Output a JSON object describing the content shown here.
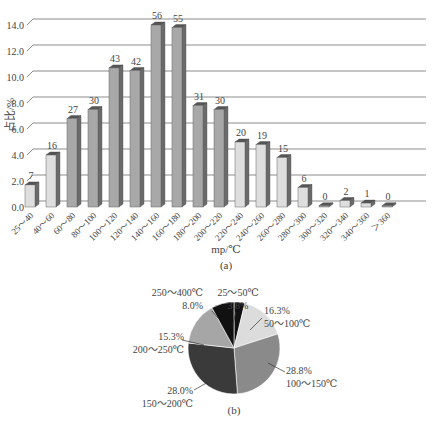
{
  "chart_data": [
    {
      "type": "bar",
      "title": "",
      "caption": "(a)",
      "xlabel": "mp/℃",
      "ylabel": "占比/%",
      "ylim": [
        0,
        14
      ],
      "yticks": [
        "0.0",
        "2.0",
        "4.0",
        "6.0",
        "8.0",
        "10.0",
        "12.0",
        "14.0"
      ],
      "grid": true,
      "categories": [
        "25～40",
        "40～60",
        "60～80",
        "80～100",
        "100～120",
        "120～140",
        "140～160",
        "160～180",
        "180～200",
        "200～220",
        "220～240",
        "240～260",
        "260～280",
        "280～300",
        "300～320",
        "320～340",
        "340～360",
        "＞360"
      ],
      "values": [
        1.7,
        4.0,
        6.8,
        7.5,
        10.7,
        10.5,
        14.0,
        13.8,
        7.8,
        7.5,
        5.0,
        4.8,
        3.8,
        1.5,
        0.0,
        0.5,
        0.3,
        0.0
      ],
      "counts": [
        7,
        16,
        27,
        30,
        43,
        42,
        56,
        55,
        31,
        30,
        20,
        19,
        15,
        6,
        0,
        2,
        1,
        0
      ],
      "bar_shade": [
        "light",
        "light",
        "dark",
        "dark",
        "dark",
        "dark",
        "dark",
        "dark",
        "dark",
        "dark",
        "light",
        "light",
        "light",
        "light",
        "dark",
        "light",
        "light",
        "dark"
      ]
    },
    {
      "type": "pie",
      "caption": "(b)",
      "slices": [
        {
          "label": "25～50℃",
          "value": 3.8,
          "pct_label": "3.8%",
          "color": "#111111"
        },
        {
          "label": "50～100℃",
          "value": 16.3,
          "pct_label": "16.3%",
          "color": "#dcdcdc"
        },
        {
          "label": "100～150℃",
          "value": 28.8,
          "pct_label": "28.8%",
          "color": "#8a8a8a"
        },
        {
          "label": "150～200℃",
          "value": 28.0,
          "pct_label": "28.0%",
          "color": "#3a3a3a"
        },
        {
          "label": "200～250℃",
          "value": 15.3,
          "pct_label": "15.3%",
          "color": "#a6a6a6"
        },
        {
          "label": "250～400℃",
          "value": 8.0,
          "pct_label": "8.0%",
          "color": "#111111"
        }
      ]
    }
  ],
  "colors": {
    "bar_light": "#dedede",
    "bar_dark": "#a8a8a8",
    "bar_side": "#6a6a6a",
    "bar_top": "#555555",
    "grid": "#8c8c8c"
  }
}
